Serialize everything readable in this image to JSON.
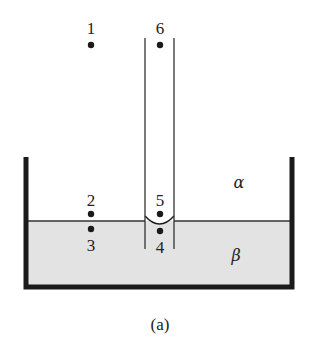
{
  "diagram": {
    "caption": "(a)",
    "phases": {
      "upper": "α",
      "lower": "β"
    },
    "points": [
      {
        "label": "1",
        "x": 91,
        "y_dot": 45,
        "y_label": 28
      },
      {
        "label": "6",
        "x": 160,
        "y_dot": 45,
        "y_label": 28
      },
      {
        "label": "2",
        "x": 91,
        "y_dot": 214,
        "y_label": 200
      },
      {
        "label": "3",
        "x": 91,
        "y_dot": 229,
        "y_label": 245
      },
      {
        "label": "5",
        "x": 160,
        "y_dot": 214,
        "y_label": 200
      },
      {
        "label": "4",
        "x": 160,
        "y_dot": 232,
        "y_label": 247
      }
    ],
    "colors": {
      "liquid_fill": "#e3e3e3",
      "line": "#1a1a1a"
    }
  }
}
